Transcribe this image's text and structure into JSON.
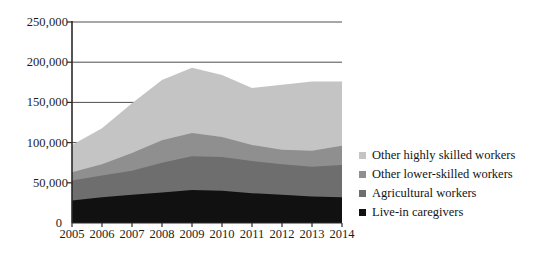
{
  "chart_data": {
    "type": "area",
    "stacked": true,
    "title": "",
    "xlabel": "",
    "ylabel": "",
    "categories": [
      "2005",
      "2006",
      "2007",
      "2008",
      "2009",
      "2010",
      "2011",
      "2012",
      "2013",
      "2014"
    ],
    "x": [
      2005,
      2006,
      2007,
      2008,
      2009,
      2010,
      2011,
      2012,
      2013,
      2014
    ],
    "ylim": [
      0,
      250000
    ],
    "yticks": [
      0,
      50000,
      100000,
      150000,
      200000,
      250000
    ],
    "ytick_labels": [
      "0",
      "50,000",
      "100,000",
      "150,000",
      "200,000",
      "250,000"
    ],
    "grid": true,
    "legend_position": "right",
    "series": [
      {
        "name": "Live-in caregivers",
        "color": "#111111",
        "values": [
          28000,
          32000,
          35000,
          38000,
          41000,
          40000,
          37000,
          35000,
          33000,
          32000
        ]
      },
      {
        "name": "Agricultural workers",
        "color": "#6e6e6e",
        "values": [
          25000,
          27000,
          30000,
          37000,
          42000,
          42000,
          40000,
          38000,
          37000,
          40000
        ]
      },
      {
        "name": "Other  lower-skilled workers",
        "color": "#8f8f8f",
        "values": [
          10000,
          14000,
          22000,
          28000,
          29000,
          25000,
          20000,
          18000,
          20000,
          24000
        ]
      },
      {
        "name": "Other  highly skilled workers",
        "color": "#c4c4c4",
        "values": [
          34000,
          45000,
          62000,
          75000,
          81000,
          77000,
          71000,
          81000,
          86000,
          80000
        ]
      }
    ],
    "totals": [
      97000,
      118000,
      149000,
      178000,
      193000,
      184000,
      168000,
      172000,
      176000,
      176000
    ],
    "zero_label": "0"
  },
  "legend": {
    "items": [
      {
        "label": "Other  highly skilled workers",
        "color": "#c4c4c4"
      },
      {
        "label": "Other  lower-skilled workers",
        "color": "#8f8f8f"
      },
      {
        "label": "Agricultural workers",
        "color": "#6e6e6e"
      },
      {
        "label": "Live-in caregivers",
        "color": "#111111"
      }
    ]
  },
  "axes": {
    "axis_color": "#2a2a2a",
    "grid_color": "#3a3a3a"
  }
}
